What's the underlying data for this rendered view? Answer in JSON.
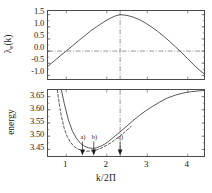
{
  "figure": {
    "xlabel": "k/2Π",
    "panels": [
      {
        "id": "top",
        "ylabel_main": "λ",
        "ylabel_sub": "e",
        "ylabel_tail": "(k)",
        "yticks": [
          "1.5",
          "1.0",
          "0.5",
          "0.0",
          "-0.5",
          "-1.0"
        ]
      },
      {
        "id": "bottom",
        "ylabel_main": "energy",
        "yticks": [
          "3.65",
          "3.60",
          "3.55",
          "3.50",
          "3.45"
        ]
      }
    ],
    "xticks": [
      "1",
      "2",
      "3",
      "4"
    ],
    "annotations": [
      {
        "label": "a)",
        "x": 1.4
      },
      {
        "label": "b)",
        "x": 1.68
      },
      {
        "label": "c)",
        "x": 2.33
      }
    ]
  },
  "chart_data": [
    {
      "type": "line",
      "panel": "top",
      "title": "",
      "xlabel": "k/2Π",
      "ylabel": "λ_e(k)",
      "xlim": [
        0.55,
        4.4
      ],
      "ylim": [
        -1.15,
        1.65
      ],
      "yticks": [
        1.5,
        1.0,
        0.5,
        0.0,
        -0.5,
        -1.0
      ],
      "xticks": [
        1,
        2,
        3,
        4
      ],
      "grid": false,
      "reference_lines": [
        {
          "orientation": "horizontal",
          "value": 0.0,
          "style": "dash-dot"
        },
        {
          "orientation": "vertical",
          "value": 2.33,
          "style": "dash-dot"
        }
      ],
      "series": [
        {
          "name": "lambda_e",
          "style": "solid",
          "x": [
            0.55,
            0.7,
            0.85,
            1.0,
            1.15,
            1.3,
            1.45,
            1.6,
            1.75,
            1.9,
            2.05,
            2.2,
            2.33,
            2.5,
            2.65,
            2.8,
            2.95,
            3.1,
            3.25,
            3.4,
            3.55,
            3.7,
            3.85,
            4.0,
            4.15,
            4.3,
            4.4
          ],
          "y": [
            -0.62,
            -0.41,
            -0.2,
            0.0,
            0.21,
            0.42,
            0.62,
            0.83,
            1.0,
            1.17,
            1.32,
            1.44,
            1.5,
            1.47,
            1.4,
            1.3,
            1.16,
            1.0,
            0.82,
            0.62,
            0.4,
            0.17,
            -0.07,
            -0.32,
            -0.57,
            -0.8,
            -0.93
          ]
        }
      ]
    },
    {
      "type": "line",
      "panel": "bottom",
      "title": "",
      "xlabel": "k/2Π",
      "ylabel": "energy",
      "xlim": [
        0.55,
        4.4
      ],
      "ylim": [
        3.425,
        3.675
      ],
      "yticks": [
        3.65,
        3.6,
        3.55,
        3.5,
        3.45
      ],
      "xticks": [
        1,
        2,
        3,
        4
      ],
      "grid": false,
      "reference_lines": [
        {
          "orientation": "vertical",
          "value": 2.33,
          "style": "dash-dot"
        }
      ],
      "series": [
        {
          "name": "energy-solid",
          "style": "solid",
          "x": [
            0.88,
            0.95,
            1.05,
            1.15,
            1.25,
            1.35,
            1.45,
            1.55,
            1.65,
            1.75,
            1.85,
            1.95,
            2.05,
            2.2,
            2.35,
            2.5,
            2.65,
            2.8,
            2.95,
            3.1,
            3.3,
            3.5,
            3.7,
            3.9,
            4.1,
            4.3,
            4.4
          ],
          "y": [
            3.675,
            3.625,
            3.563,
            3.52,
            3.492,
            3.473,
            3.462,
            3.456,
            3.454,
            3.456,
            3.462,
            3.47,
            3.481,
            3.5,
            3.519,
            3.539,
            3.559,
            3.578,
            3.595,
            3.61,
            3.629,
            3.645,
            3.656,
            3.664,
            3.669,
            3.672,
            3.673
          ]
        },
        {
          "name": "energy-dashed",
          "style": "dashed",
          "x": [
            0.78,
            0.83,
            0.88,
            0.95,
            1.02,
            1.1,
            1.18,
            1.28,
            1.38,
            1.5,
            1.62,
            1.75,
            1.88,
            2.0,
            2.1,
            2.2,
            2.3,
            2.4,
            2.5,
            2.6
          ],
          "y": [
            3.675,
            3.62,
            3.575,
            3.53,
            3.5,
            3.478,
            3.463,
            3.452,
            3.446,
            3.443,
            3.444,
            3.448,
            3.456,
            3.466,
            3.475,
            3.486,
            3.497,
            3.51,
            3.523,
            3.537
          ]
        }
      ],
      "annotation_markers": [
        {
          "label": "a)",
          "x": 1.4,
          "type": "arrow-down"
        },
        {
          "label": "b)",
          "x": 1.68,
          "type": "arrow-down"
        },
        {
          "label": "c)",
          "x": 2.33,
          "type": "arrow-down"
        }
      ]
    }
  ]
}
